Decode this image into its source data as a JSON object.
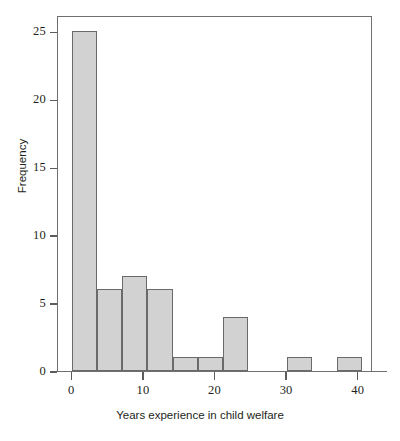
{
  "chart_data": {
    "type": "bar",
    "title": "",
    "subtitle": "",
    "xlabel": "Years experience in child welfare",
    "ylabel": "Frequency",
    "xlim": [
      -2,
      42
    ],
    "ylim": [
      0,
      26.2
    ],
    "xticks": [
      0,
      10,
      20,
      30,
      40
    ],
    "xtick_labels": [
      "0",
      "10",
      "20",
      "30",
      "40"
    ],
    "yticks": [
      0,
      5,
      10,
      15,
      20,
      25
    ],
    "ytick_labels": [
      "0",
      "5",
      "10",
      "15",
      "20",
      "25"
    ],
    "grid": false,
    "legend": null,
    "bin_width": 3.5,
    "bars": [
      {
        "bin_start": 0,
        "bin_end": 3.5,
        "value": 25
      },
      {
        "bin_start": 3.5,
        "bin_end": 7,
        "value": 6
      },
      {
        "bin_start": 7,
        "bin_end": 10.5,
        "value": 7
      },
      {
        "bin_start": 10.5,
        "bin_end": 14,
        "value": 6
      },
      {
        "bin_start": 14,
        "bin_end": 17.5,
        "value": 1
      },
      {
        "bin_start": 17.5,
        "bin_end": 21,
        "value": 1
      },
      {
        "bin_start": 21,
        "bin_end": 24.5,
        "value": 4
      },
      {
        "bin_start": 30,
        "bin_end": 33.5,
        "value": 1
      },
      {
        "bin_start": 37,
        "bin_end": 40.5,
        "value": 1
      }
    ],
    "categories": [
      "0-3.5",
      "3.5-7",
      "7-10.5",
      "10.5-14",
      "14-17.5",
      "17.5-21",
      "21-24.5",
      "30-33.5",
      "37-40.5"
    ],
    "values": [
      25,
      6,
      7,
      6,
      1,
      1,
      4,
      1,
      1
    ],
    "colors": {
      "bar_fill": "#d2d2d2",
      "bar_stroke": "#6a6a6a",
      "axis": "#6f6f6f",
      "text": "#231f20",
      "background": "#ffffff"
    }
  }
}
